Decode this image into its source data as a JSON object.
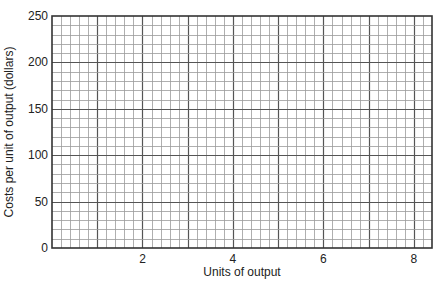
{
  "chart_data": {
    "type": "line",
    "title": "",
    "xlabel": "Units of output",
    "ylabel": "Costs per unit of output (dollars)",
    "xlim": [
      0,
      8.4
    ],
    "ylim": [
      0,
      250
    ],
    "x_ticks": [
      2,
      4,
      6,
      8
    ],
    "x_tick_labels": [
      "2",
      "4",
      "6",
      "8"
    ],
    "y_ticks": [
      0,
      50,
      100,
      150,
      200,
      250
    ],
    "y_tick_labels": [
      "0",
      "50",
      "100",
      "150",
      "200",
      "250"
    ],
    "x_minor_step": 0.2,
    "y_minor_step": 10,
    "grid": true,
    "series": [],
    "legend": null,
    "note": "Blank graph-paper grid with no plotted data"
  },
  "colors": {
    "frame": "#333333",
    "major_grid": "#555555",
    "minor_grid": "#9a9a9a",
    "background": "#ffffff"
  }
}
